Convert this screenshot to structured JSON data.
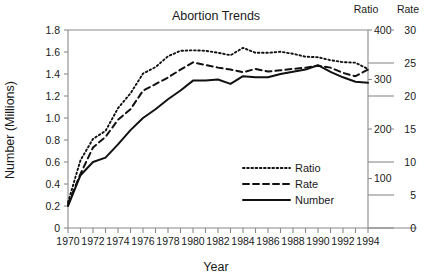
{
  "chart_data": {
    "type": "line",
    "title": "Abortion Trends",
    "xlabel": "Year",
    "ylabel": "Number (Millions)",
    "grid": false,
    "legend_position": "center-right-inside",
    "x": [
      1970,
      1971,
      1972,
      1973,
      1974,
      1975,
      1976,
      1977,
      1978,
      1979,
      1980,
      1981,
      1982,
      1983,
      1984,
      1985,
      1986,
      1987,
      1988,
      1989,
      1990,
      1991,
      1992,
      1993,
      1994
    ],
    "xlim": [
      1970,
      1994
    ],
    "xtick_labels": [
      "1970",
      "1972",
      "1974",
      "1976",
      "1978",
      "1980",
      "1982",
      "1984",
      "1986",
      "1988",
      "1990",
      "1992",
      "1994"
    ],
    "xtick_values": [
      1970,
      1972,
      1974,
      1976,
      1978,
      1980,
      1982,
      1984,
      1986,
      1988,
      1990,
      1992,
      1994
    ],
    "xtick_minor_values": [
      1971,
      1973,
      1975,
      1977,
      1979,
      1981,
      1983,
      1985,
      1987,
      1989,
      1991,
      1993
    ],
    "axes": [
      {
        "id": "left",
        "name": "Number (Millions)",
        "header": "",
        "lim": [
          0,
          1.8
        ],
        "ticks": [
          0,
          0.2,
          0.4,
          0.6,
          0.8,
          1.0,
          1.2,
          1.4,
          1.6,
          1.8
        ],
        "tick_labels": [
          "0",
          "0.2",
          "0.4",
          "0.6",
          "0.8",
          "1.0",
          "1.2",
          "1.4",
          "1.6",
          "1.8"
        ]
      },
      {
        "id": "ratio",
        "name": "Ratio",
        "header": "Ratio",
        "lim": [
          0,
          400
        ],
        "ticks": [
          0,
          100,
          200,
          300,
          400
        ],
        "tick_labels": [
          "0",
          "100",
          "200",
          "300",
          "400"
        ]
      },
      {
        "id": "rate",
        "name": "Rate",
        "header": "Rate",
        "lim": [
          0,
          30
        ],
        "ticks": [
          0,
          5,
          10,
          15,
          20,
          25,
          30
        ],
        "tick_labels": [
          "0",
          "5",
          "10",
          "15",
          "20",
          "25",
          "30"
        ]
      }
    ],
    "series": [
      {
        "name": "Ratio",
        "style": "dotted",
        "axis": "ratio",
        "unit": "abortions per 1000 live births",
        "values": [
          52,
          137,
          180,
          196,
          242,
          272,
          312,
          325,
          347,
          358,
          359,
          358,
          354,
          349,
          364,
          354,
          354,
          356,
          352,
          346,
          345,
          339,
          335,
          334,
          321
        ]
      },
      {
        "name": "Rate",
        "style": "dashed",
        "axis": "rate",
        "unit": "abortions per 1000 women aged 15-44",
        "values": [
          3.6,
          8.2,
          12.2,
          13.8,
          16.4,
          18.0,
          20.8,
          21.8,
          22.8,
          24.0,
          25.1,
          24.7,
          24.3,
          24.0,
          23.6,
          24.1,
          23.7,
          23.9,
          24.1,
          24.3,
          24.6,
          24.3,
          23.5,
          23.0,
          24.0
        ]
      },
      {
        "name": "Number",
        "style": "solid",
        "axis": "left",
        "unit": "millions of abortions",
        "values": [
          0.2,
          0.48,
          0.6,
          0.64,
          0.76,
          0.89,
          1.0,
          1.08,
          1.17,
          1.25,
          1.34,
          1.34,
          1.35,
          1.31,
          1.38,
          1.37,
          1.37,
          1.4,
          1.42,
          1.44,
          1.48,
          1.42,
          1.37,
          1.33,
          1.32
        ]
      }
    ],
    "legend": [
      {
        "label": "Ratio",
        "style": "dotted"
      },
      {
        "label": "Rate",
        "style": "dashed"
      },
      {
        "label": "Number",
        "style": "solid"
      }
    ],
    "colors": {
      "line": "#111111",
      "axis": "#8a8a8a",
      "text": "#1a1a1a",
      "background": "#ffffff"
    }
  }
}
